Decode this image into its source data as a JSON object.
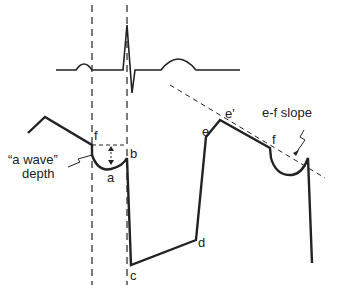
{
  "diagram": {
    "labels": {
      "f_left": "f",
      "b": "b",
      "a": "a",
      "c": "c",
      "d": "d",
      "e": "e",
      "e_prime": "e'",
      "f_right": "f",
      "a_wave_line1": "“a wave”",
      "a_wave_line2": "depth",
      "ef_slope": "e-f slope"
    },
    "colors": {
      "line": "#222222",
      "background": "#ffffff"
    }
  }
}
